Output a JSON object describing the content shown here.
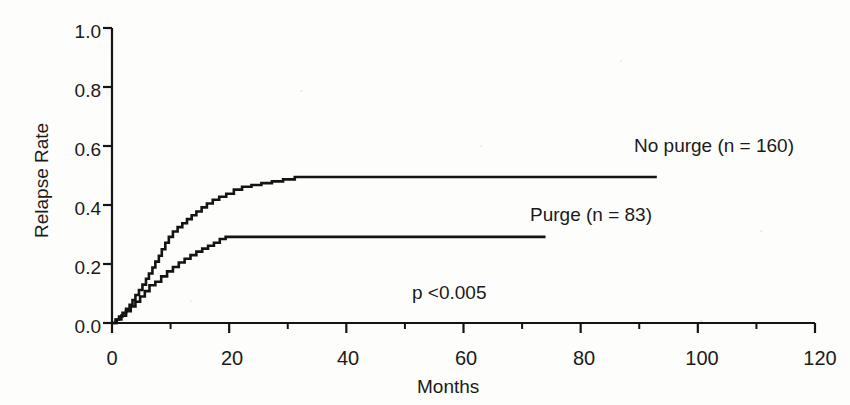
{
  "chart_data": {
    "type": "line",
    "title": "",
    "subtitle": "",
    "xlabel": "Months",
    "ylabel": "Relapse Rate",
    "xlim": [
      0,
      120
    ],
    "ylim": [
      0.0,
      1.0
    ],
    "xticks": [
      0,
      20,
      40,
      60,
      80,
      100,
      120
    ],
    "xtick_labels": [
      "0",
      "20",
      "40",
      "60",
      "80",
      "100",
      "120"
    ],
    "xminor_ticks": [
      10,
      30,
      50,
      70,
      90,
      110
    ],
    "yticks": [
      0.0,
      0.2,
      0.4,
      0.6,
      0.8,
      1.0
    ],
    "ytick_labels": [
      "0.0",
      "0.2",
      "0.4",
      "0.6",
      "0.8",
      "1.0"
    ],
    "grid": false,
    "legend_position": "inline-annotation",
    "annotations": [
      {
        "name": "no-purge-label",
        "text": "No purge (n = 160)",
        "x": 78,
        "y": 0.6
      },
      {
        "name": "purge-label",
        "text": "Purge (n = 83)",
        "x": 62,
        "y": 0.365
      },
      {
        "name": "pvalue-label",
        "text": "p <0.005",
        "x": 42,
        "y": 0.085
      }
    ],
    "series": [
      {
        "name": "No purge (n = 160)",
        "n": 160,
        "color": "#141414",
        "plateau_value": 0.495,
        "end_x": 93,
        "points": [
          [
            0,
            0.0
          ],
          [
            0.6,
            0.0
          ],
          [
            0.6,
            0.012
          ],
          [
            1.2,
            0.012
          ],
          [
            1.2,
            0.022
          ],
          [
            1.8,
            0.022
          ],
          [
            1.8,
            0.035
          ],
          [
            2.4,
            0.035
          ],
          [
            2.4,
            0.048
          ],
          [
            3.0,
            0.048
          ],
          [
            3.0,
            0.062
          ],
          [
            3.5,
            0.062
          ],
          [
            3.5,
            0.078
          ],
          [
            4.0,
            0.078
          ],
          [
            4.0,
            0.095
          ],
          [
            4.6,
            0.095
          ],
          [
            4.6,
            0.112
          ],
          [
            5.2,
            0.112
          ],
          [
            5.2,
            0.13
          ],
          [
            5.8,
            0.13
          ],
          [
            5.8,
            0.15
          ],
          [
            6.3,
            0.15
          ],
          [
            6.3,
            0.168
          ],
          [
            6.9,
            0.168
          ],
          [
            6.9,
            0.188
          ],
          [
            7.4,
            0.188
          ],
          [
            7.4,
            0.208
          ],
          [
            8.0,
            0.208
          ],
          [
            8.0,
            0.228
          ],
          [
            8.5,
            0.228
          ],
          [
            8.5,
            0.25
          ],
          [
            9.1,
            0.25
          ],
          [
            9.1,
            0.272
          ],
          [
            9.7,
            0.272
          ],
          [
            9.7,
            0.292
          ],
          [
            10.4,
            0.292
          ],
          [
            10.4,
            0.31
          ],
          [
            11.2,
            0.31
          ],
          [
            11.2,
            0.325
          ],
          [
            12.0,
            0.325
          ],
          [
            12.0,
            0.338
          ],
          [
            12.8,
            0.338
          ],
          [
            12.8,
            0.352
          ],
          [
            13.6,
            0.352
          ],
          [
            13.6,
            0.365
          ],
          [
            14.4,
            0.365
          ],
          [
            14.4,
            0.378
          ],
          [
            15.3,
            0.378
          ],
          [
            15.3,
            0.392
          ],
          [
            16.2,
            0.392
          ],
          [
            16.2,
            0.405
          ],
          [
            17.2,
            0.405
          ],
          [
            17.2,
            0.418
          ],
          [
            18.3,
            0.418
          ],
          [
            18.3,
            0.428
          ],
          [
            19.5,
            0.428
          ],
          [
            19.5,
            0.438
          ],
          [
            20.8,
            0.438
          ],
          [
            20.8,
            0.452
          ],
          [
            22.2,
            0.452
          ],
          [
            22.2,
            0.462
          ],
          [
            23.8,
            0.462
          ],
          [
            23.8,
            0.468
          ],
          [
            25.5,
            0.468
          ],
          [
            25.5,
            0.474
          ],
          [
            27.3,
            0.474
          ],
          [
            27.3,
            0.48
          ],
          [
            29.2,
            0.48
          ],
          [
            29.2,
            0.487
          ],
          [
            31.2,
            0.487
          ],
          [
            31.2,
            0.495
          ],
          [
            93,
            0.495
          ]
        ]
      },
      {
        "name": "Purge (n = 83)",
        "n": 83,
        "color": "#141414",
        "plateau_value": 0.292,
        "end_x": 74,
        "points": [
          [
            0,
            0.0
          ],
          [
            0.8,
            0.0
          ],
          [
            0.8,
            0.012
          ],
          [
            1.6,
            0.012
          ],
          [
            1.6,
            0.025
          ],
          [
            2.4,
            0.025
          ],
          [
            2.4,
            0.04
          ],
          [
            3.2,
            0.04
          ],
          [
            3.2,
            0.056
          ],
          [
            4.0,
            0.056
          ],
          [
            4.0,
            0.072
          ],
          [
            4.8,
            0.072
          ],
          [
            4.8,
            0.09
          ],
          [
            5.6,
            0.09
          ],
          [
            5.6,
            0.108
          ],
          [
            6.4,
            0.108
          ],
          [
            6.4,
            0.128
          ],
          [
            7.4,
            0.128
          ],
          [
            7.4,
            0.14
          ],
          [
            8.4,
            0.14
          ],
          [
            8.4,
            0.158
          ],
          [
            9.4,
            0.158
          ],
          [
            9.4,
            0.175
          ],
          [
            10.4,
            0.175
          ],
          [
            10.4,
            0.19
          ],
          [
            11.4,
            0.19
          ],
          [
            11.4,
            0.205
          ],
          [
            12.4,
            0.205
          ],
          [
            12.4,
            0.218
          ],
          [
            13.4,
            0.218
          ],
          [
            13.4,
            0.23
          ],
          [
            14.4,
            0.23
          ],
          [
            14.4,
            0.242
          ],
          [
            15.4,
            0.242
          ],
          [
            15.4,
            0.252
          ],
          [
            16.4,
            0.252
          ],
          [
            16.4,
            0.262
          ],
          [
            17.4,
            0.262
          ],
          [
            17.4,
            0.272
          ],
          [
            18.4,
            0.272
          ],
          [
            18.4,
            0.285
          ],
          [
            19.4,
            0.285
          ],
          [
            19.4,
            0.292
          ],
          [
            74,
            0.292
          ]
        ]
      }
    ]
  },
  "axis": {
    "y_title": "Relapse Rate",
    "x_title": "Months"
  }
}
